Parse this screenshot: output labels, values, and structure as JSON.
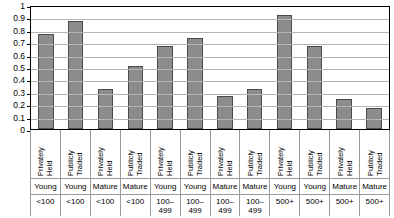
{
  "chart_data": {
    "type": "bar",
    "title": "",
    "subtitle": "",
    "xlabel": "",
    "ylabel": "",
    "ylim": [
      0,
      1
    ],
    "grid": true,
    "legend": "none",
    "categories": [
      "Privately Held Young <100",
      "Publicly Traded Young <100",
      "Privately Held Mature <100",
      "Publicly Traded Mature <100",
      "Privately Held Young 100–499",
      "Publicly Traded Young 100–499",
      "Privately Held Mature 100–499",
      "Publicly Traded Mature 100–499",
      "Privately Held Young 500+",
      "Publicly Traded Young 500+",
      "Privately Held Mature 500+",
      "Publicly Traded Mature 500+"
    ],
    "values": [
      0.77,
      0.87,
      0.32,
      0.51,
      0.67,
      0.73,
      0.27,
      0.32,
      0.92,
      0.67,
      0.24,
      0.17
    ],
    "ytick_labels": [
      "1",
      "0.9",
      "0.8",
      "0.7",
      "0.6",
      "0.5",
      "0.4",
      "0.3",
      "0.2",
      "0.1",
      "0"
    ],
    "ytick_values": [
      1,
      0.9,
      0.8,
      0.7,
      0.6,
      0.5,
      0.4,
      0.3,
      0.2,
      0.1,
      0
    ],
    "colors": {
      "bar_fill": "#8c8c8c",
      "bar_border": "#4a4a4a",
      "gridline": "#b5b5b5",
      "axis": "#000000",
      "background": "#ffffff"
    }
  },
  "axis_labels": {
    "ownership": [
      {
        "line1": "Privately",
        "line2": "Held"
      },
      {
        "line1": "Publicly",
        "line2": "Traded"
      },
      {
        "line1": "Privately",
        "line2": "Held"
      },
      {
        "line1": "Publicly",
        "line2": "Traded"
      },
      {
        "line1": "Privately",
        "line2": "Held"
      },
      {
        "line1": "Publicly",
        "line2": "Traded"
      },
      {
        "line1": "Privately",
        "line2": "Held"
      },
      {
        "line1": "Publicly",
        "line2": "Traded"
      },
      {
        "line1": "Privately",
        "line2": "Held"
      },
      {
        "line1": "Publicly",
        "line2": "Traded"
      },
      {
        "line1": "Privately",
        "line2": "Held"
      },
      {
        "line1": "Publicly",
        "line2": "Traded"
      }
    ],
    "age": [
      "Young",
      "Young",
      "Mature",
      "Mature",
      "Young",
      "Young",
      "Mature",
      "Mature",
      "Young",
      "Young",
      "Mature",
      "Mature"
    ],
    "size": [
      "<100",
      "<100",
      "<100",
      "<100",
      "100–\n499",
      "100–\n499",
      "100–\n499",
      "100–\n499",
      "500+",
      "500+",
      "500+",
      "500+"
    ]
  }
}
